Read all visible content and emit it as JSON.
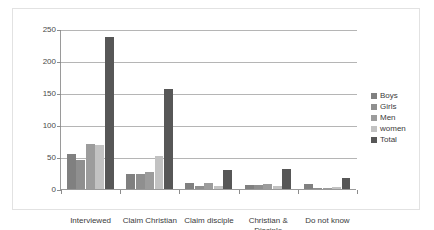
{
  "chart_data": {
    "type": "bar",
    "title": "",
    "subtitle": "",
    "xlabel": "",
    "ylabel": "",
    "ylim": [
      0,
      250
    ],
    "y_ticks": [
      0,
      50,
      100,
      150,
      200,
      250
    ],
    "grid": true,
    "legend_position": "right",
    "categories": [
      "Interviewed",
      "Claim Christian",
      "Claim disciple",
      "Christian & Disciple",
      "Do not know"
    ],
    "category_lines": [
      [
        "Interviewed"
      ],
      [
        "Claim Christian"
      ],
      [
        "Claim disciple"
      ],
      [
        "Christian &",
        "Disciple"
      ],
      [
        "Do not know"
      ]
    ],
    "series": [
      {
        "name": "Boys",
        "color": "#808080",
        "values": [
          54,
          24,
          9,
          7,
          8
        ]
      },
      {
        "name": "Girls",
        "color": "#8f8f8f",
        "values": [
          45,
          23,
          5,
          6,
          2
        ]
      },
      {
        "name": "Men",
        "color": "#9c9c9c",
        "values": [
          70,
          26,
          9,
          8,
          1
        ]
      },
      {
        "name": "women",
        "color": "#c2c2c2",
        "values": [
          69,
          52,
          4,
          4,
          3
        ]
      },
      {
        "name": "Total",
        "color": "#575757",
        "values": [
          238,
          156,
          30,
          31,
          17
        ]
      }
    ]
  },
  "axis": {
    "tick_labels": [
      "250",
      "200",
      "150",
      "100",
      "50",
      "0"
    ]
  }
}
